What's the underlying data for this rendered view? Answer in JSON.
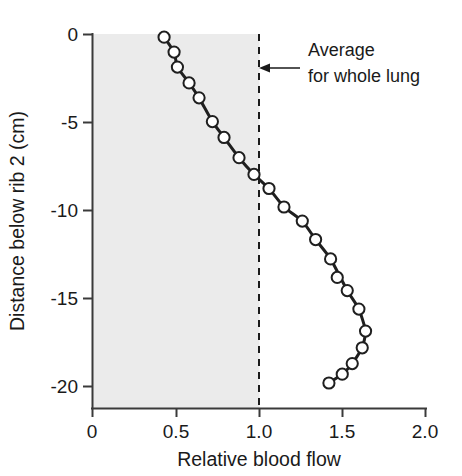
{
  "chart_data": {
    "type": "line",
    "title": "",
    "subtitle": "",
    "xlabel": "Relative blood flow",
    "ylabel": "Distance below rib 2 (cm)",
    "xlim": [
      0,
      2.0
    ],
    "ylim": [
      -20.6,
      0.4
    ],
    "grid": false,
    "legend_position": "none",
    "xticks": [
      "0",
      "0.5",
      "1.0",
      "1.5",
      "2.0"
    ],
    "xtick_values": [
      0,
      0.5,
      1.0,
      1.5,
      2.0
    ],
    "yticks": [
      "0",
      "-5",
      "-10",
      "-15",
      "-20"
    ],
    "ytick_values": [
      0,
      -5,
      -10,
      -15,
      -20
    ],
    "series": [
      {
        "name": "Relative blood flow",
        "marker": "open-circle",
        "x": [
          0.43,
          0.49,
          0.51,
          0.58,
          0.64,
          0.72,
          0.79,
          0.88,
          0.97,
          1.06,
          1.15,
          1.26,
          1.34,
          1.43,
          1.53,
          1.6,
          1.64,
          1.62,
          1.56,
          1.5,
          1.42
        ],
        "y": [
          -0.15,
          -1.0,
          -1.85,
          -2.75,
          -3.6,
          -4.95,
          -5.85,
          -7.0,
          -7.95,
          -8.75,
          -9.8,
          -10.6,
          -11.65,
          -12.75,
          -14.55,
          -15.6,
          -16.85,
          -17.8,
          -18.7,
          -19.3,
          -19.8
        ]
      },
      {
        "name": "Outlier point",
        "marker": "open-circle",
        "x": [
          1.47
        ],
        "y": [
          -13.8
        ]
      }
    ],
    "annotations": [
      {
        "name": "average-for-whole-lung",
        "text_line1": "Average",
        "text_line2": "for whole lung",
        "points_to_x": 1.0,
        "points_to_y": -1.7,
        "arrow_direction": "left"
      }
    ],
    "reference_lines": [
      {
        "name": "average-whole-lung-line",
        "orientation": "vertical",
        "value": 1.0,
        "style": "dashed"
      }
    ],
    "shaded_regions": [
      {
        "name": "left-shading",
        "from_x": 0,
        "to_x": 1.0,
        "color": "#ebebeb"
      }
    ],
    "colors": {
      "curve": "#1f1f1f",
      "marker_fill": "#ffffff",
      "marker_stroke": "#1f1f1f",
      "axis": "#3a3a3a",
      "shading": "#ebebeb",
      "text": "#1a1a1a"
    }
  }
}
